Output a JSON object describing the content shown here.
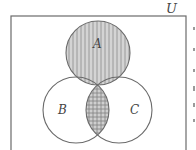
{
  "diagram": {
    "type": "venn",
    "universe_label": "U",
    "sets": [
      {
        "name": "A",
        "label": "A",
        "shaded": "vertical-lines"
      },
      {
        "name": "B",
        "label": "B",
        "shaded": "none"
      },
      {
        "name": "C",
        "label": "C",
        "shaded": "none"
      }
    ],
    "highlighted_regions": [
      {
        "region": "A",
        "pattern": "vertical-lines"
      },
      {
        "region": "B ∩ C",
        "pattern": "horizontal-lines (cross-hatched where overlapping A)"
      }
    ],
    "colors": {
      "stroke": "#6b6b6b",
      "fill_gray": "#d4d4d4",
      "hatch": "#8a8a8a",
      "background": "#ffffff"
    }
  }
}
